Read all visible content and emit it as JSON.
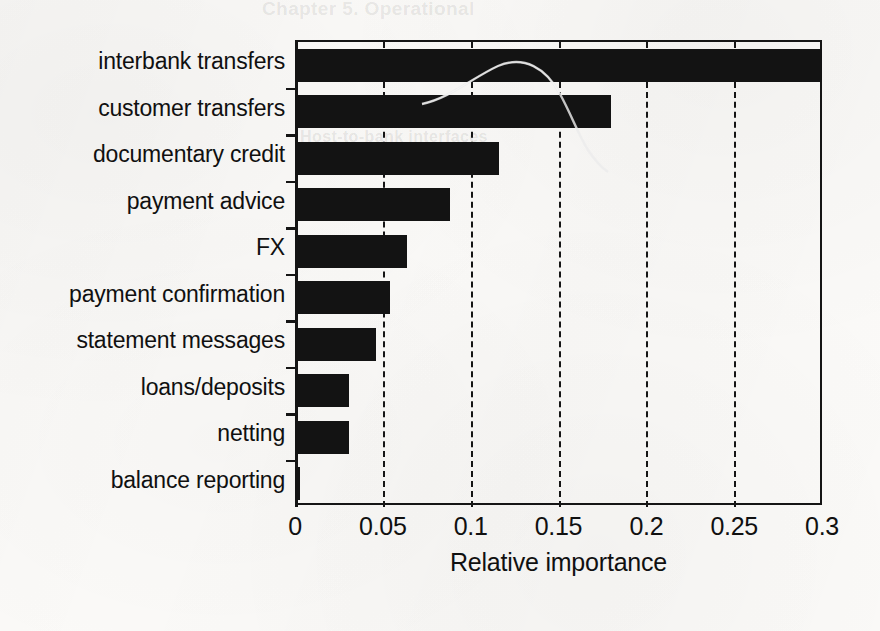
{
  "chart_data": {
    "type": "bar",
    "orientation": "horizontal",
    "title": "",
    "xlabel": "Relative importance",
    "ylabel": "",
    "categories": [
      "interbank transfers",
      "customer transfers",
      "documentary credit",
      "payment advice",
      "FX",
      "payment confirmation",
      "statement messages",
      "loans/deposits",
      "netting",
      "balance reporting"
    ],
    "values": [
      0.3,
      0.18,
      0.116,
      0.088,
      0.064,
      0.054,
      0.046,
      0.031,
      0.031,
      0.003
    ],
    "xlim": [
      0,
      0.3
    ],
    "xticks": [
      0,
      0.05,
      0.1,
      0.15,
      0.2,
      0.25,
      0.3
    ],
    "xtick_labels": [
      "0",
      "0.05",
      "0.1",
      "0.15",
      "0.2",
      "0.25",
      "0.3"
    ],
    "grid": "vertical-dashed",
    "legend": "none",
    "bar_color": "#121212",
    "background_color": "#fbfaf8"
  },
  "artifacts": {
    "scan_curve": "faint curved line over top bars",
    "ghost_text": [
      "Chapter 5. Operational",
      "5. Application Modes",
      "Host-to-bank interfaces",
      "transaction volumes"
    ]
  }
}
